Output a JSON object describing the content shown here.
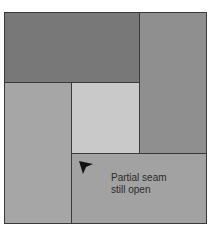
{
  "diagram": {
    "panels": [
      {
        "id": "top-left",
        "color": "#787878"
      },
      {
        "id": "right",
        "color": "#8f8f8f"
      },
      {
        "id": "left-bottom",
        "color": "#a6a6a6"
      },
      {
        "id": "center",
        "color": "#c9c9c9"
      },
      {
        "id": "bottom-right",
        "color": "#a2a2a2"
      }
    ],
    "annotation": {
      "line1": "Partial seam",
      "line2": "still open"
    },
    "arrow_color": "#111111"
  }
}
